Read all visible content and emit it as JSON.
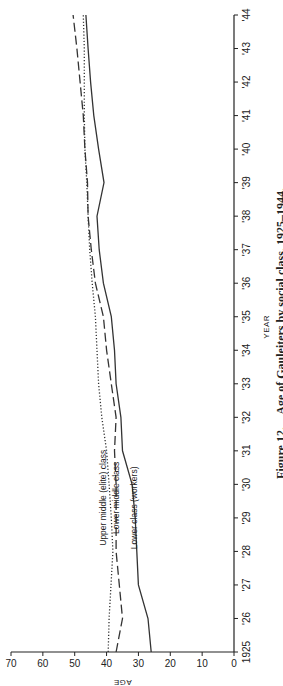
{
  "chart_data": {
    "type": "line",
    "title": "Age of Gauleiters by social class, 1925–1944.",
    "caption_prefix": "Figure 12.",
    "caption": "Age of Gauleiters by social class, 1925–1944.",
    "xlabel": "YEAR",
    "ylabel": "AGE",
    "x": [
      1925,
      1926,
      1927,
      1928,
      1929,
      1930,
      1931,
      1932,
      1933,
      1934,
      1935,
      1936,
      1937,
      1938,
      1939,
      1940,
      1941,
      1942,
      1943,
      1944
    ],
    "x_tick_labels": [
      "1925",
      "'26",
      "'27",
      "'28",
      "'29",
      "'30",
      "'31",
      "'32",
      "'33",
      "'34",
      "'35",
      "'36",
      "'37",
      "'38",
      "'39",
      "'40",
      "'41",
      "'42",
      "'43",
      "'44"
    ],
    "ylim": [
      0,
      70
    ],
    "y_ticks": [
      0,
      10,
      20,
      30,
      40,
      50,
      60,
      70
    ],
    "y_tick_labels": [
      "0",
      "10",
      "20",
      "30",
      "40",
      "50",
      "60",
      "70"
    ],
    "grid": false,
    "orientation": "rotated-90-clockwise",
    "series": [
      {
        "name": "Upper middle (elite) class",
        "style": "dotted",
        "color": "#333333",
        "values": [
          39.5,
          39.2,
          38.6,
          38.0,
          38.5,
          39.2,
          40.0,
          41.5,
          42.5,
          43.0,
          43.5,
          44.5,
          45.3,
          45.8,
          46.2,
          46.8,
          47.0,
          47.0,
          47.0,
          47.3
        ]
      },
      {
        "name": "Lower middle class",
        "style": "dashed",
        "color": "#333333",
        "values": [
          37.0,
          35.0,
          36.0,
          37.0,
          37.0,
          37.0,
          37.5,
          37.0,
          38.5,
          40.0,
          41.0,
          43.5,
          44.8,
          45.8,
          46.0,
          46.8,
          47.3,
          48.3,
          49.3,
          50.5
        ]
      },
      {
        "name": "Lower class (workers)",
        "style": "solid",
        "color": "#333333",
        "values": [
          26.0,
          27.0,
          30.0,
          30.5,
          31.0,
          32.0,
          35.0,
          35.5,
          37.0,
          37.5,
          38.5,
          41.0,
          42.3,
          43.0,
          40.8,
          42.5,
          44.0,
          45.0,
          45.8,
          46.5
        ]
      }
    ]
  }
}
